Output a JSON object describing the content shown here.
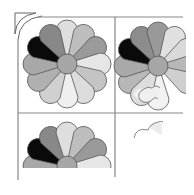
{
  "image": {
    "description": "Quilt block grid with Dresden-plate style flowers progressively incomplete",
    "background": "#ffffff"
  },
  "grid": {
    "left_x": 18,
    "mid_x": 115,
    "right_x": 183,
    "top_y": 17,
    "mid_y": 113,
    "bottom_y": 180,
    "line_color": "#888888"
  },
  "flowers": [
    {
      "name": "flower-complete",
      "cx": 67,
      "cy": 64,
      "center_r": 10,
      "petal_len": 44,
      "petal_w": 11,
      "petal_colors": [
        "#dedede",
        "#bdbdbd",
        "#9a9a9a",
        "#e6e6e6",
        "#c4c4c4",
        "#dcdcdc",
        "#efefef",
        "#d0d0d0",
        "#b0b0b0",
        "#a8a8a8",
        "#0a0a0a",
        "#888888"
      ],
      "center_color": "#a6a6a6"
    },
    {
      "name": "flower-partial-right",
      "cx": 158,
      "cy": 66,
      "center_r": 10,
      "petal_len": 44,
      "petal_w": 11,
      "visible_petals": [
        8,
        9,
        10,
        11,
        0,
        1,
        2,
        3,
        4,
        6,
        7
      ],
      "petal_colors": [
        "#999999",
        "#e0e0e0",
        "#d9d9d9",
        "#b8b8b8",
        "#cfcfcf",
        "#e5e5e5",
        "#f2f2f2",
        "#dddddd",
        "#b7b7b7",
        "#a9a9a9",
        "#0a0a0a",
        "#8c8c8c"
      ],
      "center_color": "#a6a6a6"
    },
    {
      "name": "flower-half-bottom",
      "cx": 67,
      "cy": 166,
      "center_r": 10,
      "petal_len": 44,
      "petal_w": 11,
      "visible_petals": [
        8,
        9,
        10,
        11,
        0,
        1,
        2,
        3
      ],
      "petal_colors": [
        "#dedede",
        "#bdbdbd",
        "#9a9a9a",
        "#e6e6e6",
        "#c4c4c4",
        "#dcdcdc",
        "#efefef",
        "#d0d0d0",
        "#b0b0b0",
        "#a8a8a8",
        "#0a0a0a",
        "#888888"
      ],
      "center_color": "#a6a6a6"
    }
  ],
  "fragments": {
    "upper_cell_arcs": "partial scalloped petal outlines near (148,100)",
    "lower_right_arcs": "partial scalloped outlines near (148,130)"
  }
}
